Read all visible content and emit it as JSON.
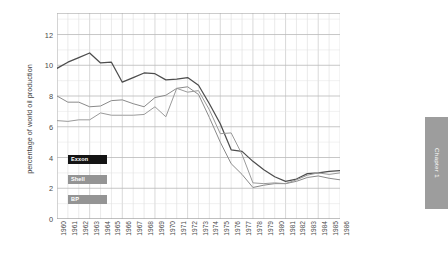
{
  "chapter_tab": {
    "label": "Chapter 1"
  },
  "chart_data": {
    "type": "line",
    "title": "",
    "xlabel": "",
    "ylabel": "percentage of world oil production",
    "ylim": [
      0,
      13.4
    ],
    "yticks": [
      0,
      2,
      4,
      6,
      8,
      10,
      12
    ],
    "grid": true,
    "legend_position": "inside-left",
    "categories": [
      "1960",
      "1961",
      "1962",
      "1963",
      "1964",
      "1965",
      "1966",
      "1967",
      "1968",
      "1969",
      "1970",
      "1971",
      "1972",
      "1973",
      "1974",
      "1975",
      "1976",
      "1977",
      "1978",
      "1979",
      "1980",
      "1981",
      "1982",
      "1983",
      "1984",
      "1985",
      "1986"
    ],
    "series": [
      {
        "name": "Exxon",
        "color": "#4d4d4d",
        "values": [
          9.8,
          10.2,
          10.5,
          10.8,
          10.15,
          10.2,
          8.9,
          9.2,
          9.5,
          9.45,
          9.05,
          9.1,
          9.2,
          8.7,
          7.5,
          6.2,
          4.5,
          4.4,
          3.75,
          3.2,
          2.75,
          2.45,
          2.6,
          2.95,
          3.0,
          3.1,
          3.15
        ]
      },
      {
        "name": "Shell",
        "color": "#8a8a8a",
        "values": [
          8.0,
          7.6,
          7.6,
          7.3,
          7.35,
          7.7,
          7.75,
          7.5,
          7.3,
          7.9,
          8.05,
          8.5,
          8.6,
          8.1,
          6.6,
          5.0,
          3.6,
          2.9,
          2.05,
          2.2,
          2.3,
          2.3,
          2.45,
          2.7,
          2.8,
          2.65,
          2.55
        ]
      },
      {
        "name": "BP",
        "color": "#9a9a9a",
        "values": [
          6.4,
          6.35,
          6.45,
          6.45,
          6.9,
          6.75,
          6.75,
          6.75,
          6.8,
          7.3,
          6.65,
          8.5,
          8.25,
          8.35,
          7.1,
          5.55,
          5.6,
          4.2,
          2.35,
          2.3,
          2.35,
          2.3,
          2.55,
          2.85,
          3.0,
          2.9,
          3.0
        ]
      }
    ],
    "legend": [
      {
        "label": "Exxon",
        "color": "#141414"
      },
      {
        "label": "Shell",
        "color": "#949494"
      },
      {
        "label": "BP",
        "color": "#949494"
      }
    ]
  }
}
